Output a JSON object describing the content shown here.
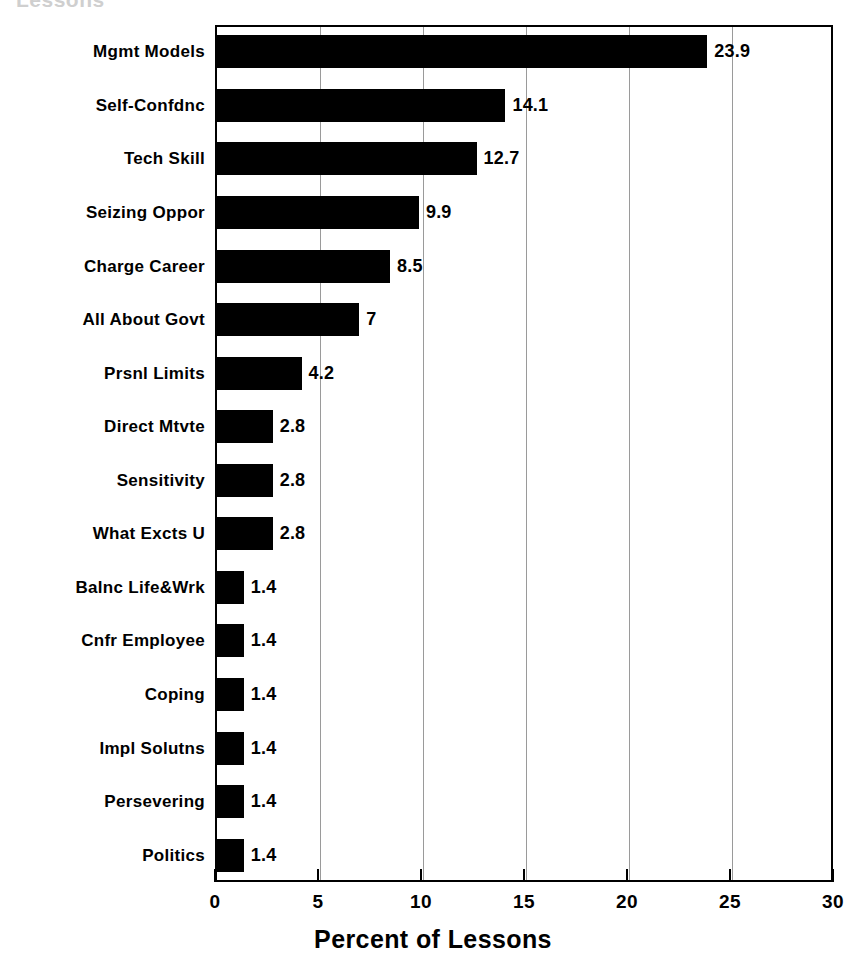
{
  "chart_data": {
    "type": "bar",
    "orientation": "horizontal",
    "title": "Lessons",
    "title_cropped": true,
    "xlabel": "Percent of Lessons",
    "ylabel": "",
    "xlim": [
      0,
      30
    ],
    "xticks": [
      0,
      5,
      10,
      15,
      20,
      25,
      30
    ],
    "xtick_labels": [
      "0",
      "5",
      "10",
      "15",
      "20",
      "25",
      "30"
    ],
    "grid": true,
    "grid_axis": "x",
    "legend": false,
    "bar_color": "#000000",
    "categories": [
      "Mgmt Models",
      "Self-Confdnc",
      "Tech Skill",
      "Seizing Oppor",
      "Charge Career",
      "All About Govt",
      "Prsnl Limits",
      "Direct Mtvte",
      "Sensitivity",
      "What Excts U",
      "Balnc Life&Wrk",
      "Cnfr Employee",
      "Coping",
      "Impl Solutns",
      "Persevering",
      "Politics"
    ],
    "values": [
      23.9,
      14.1,
      12.7,
      9.9,
      8.5,
      7,
      4.2,
      2.8,
      2.8,
      2.8,
      1.4,
      1.4,
      1.4,
      1.4,
      1.4,
      1.4
    ],
    "value_labels": [
      "23.9",
      "14.1",
      "12.7",
      "9.9",
      "8.5",
      "7",
      "4.2",
      "2.8",
      "2.8",
      "2.8",
      "1.4",
      "1.4",
      "1.4",
      "1.4",
      "1.4",
      "1.4"
    ]
  },
  "colors": {
    "bar": "#000000",
    "axis": "#000000",
    "grid": "#9a9a9a",
    "background": "#ffffff",
    "title_faded": "#cfcfcf"
  }
}
